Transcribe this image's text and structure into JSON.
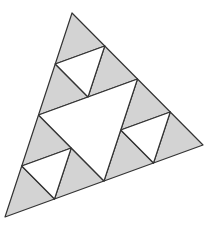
{
  "diagram": {
    "title": "",
    "type": "sierpinski-triangle",
    "level": 2,
    "colors": {
      "fill": "#d3d3d3",
      "hole": "#ffffff",
      "stroke": "#333333"
    },
    "vertices": {
      "top": [
        72,
        13
      ],
      "bottom_left": [
        5,
        217
      ],
      "right": [
        203,
        145
      ]
    },
    "shaded_triangle_count": 9,
    "white_triangle_count": 4
  }
}
